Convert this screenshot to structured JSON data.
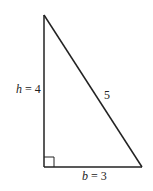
{
  "diagram": {
    "type": "right-triangle",
    "colors": {
      "stroke": "#222222",
      "background": "#ffffff"
    },
    "vertices": {
      "top": [
        44,
        15
      ],
      "bottom_left": [
        44,
        167
      ],
      "bottom_right": [
        142,
        167
      ]
    },
    "right_angle_marker": {
      "corner": "bottom_left",
      "size": 10
    },
    "labels": {
      "height": {
        "variable": "h",
        "equals": " = ",
        "value": "4",
        "x": 16,
        "y": 93
      },
      "base": {
        "variable": "b",
        "equals": " = ",
        "value": "3",
        "x": 82,
        "y": 180
      },
      "hypotenuse": {
        "value": "5",
        "x": 104,
        "y": 99
      }
    }
  }
}
